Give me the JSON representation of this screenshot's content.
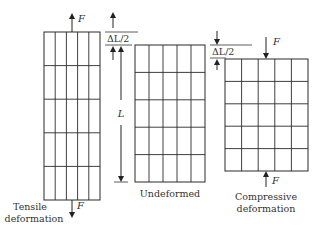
{
  "diagram": {
    "panels": [
      {
        "id": "tensile",
        "caption_lines": [
          "Tensile",
          "deformation"
        ],
        "force_label": "F",
        "grid_cols": 5,
        "grid_rows": 5
      },
      {
        "id": "undeformed",
        "caption_lines": [
          "Undeformed"
        ],
        "grid_cols": 5,
        "grid_rows": 5
      },
      {
        "id": "compressive",
        "caption_lines": [
          "Compressive",
          "deformation"
        ],
        "force_label": "F",
        "grid_cols": 5,
        "grid_rows": 5
      }
    ],
    "dimension_labels": {
      "delta_tensile": "ΔL/2",
      "delta_compressive": "ΔL/2",
      "length": "L"
    },
    "colors": {
      "line": "#2a2a2a",
      "text": "#333333"
    }
  }
}
